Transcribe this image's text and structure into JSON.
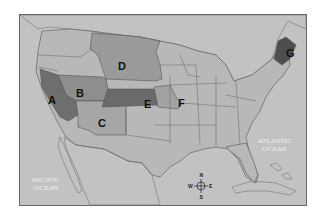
{
  "map": {
    "title": "",
    "colors": {
      "ocean": "#c2c2c2",
      "canada": "#e2e2e2",
      "mexico": "#e4e4e4",
      "us_default": "#b8b8b8",
      "region_A": "#6e6e6e",
      "region_B": "#8e8e8e",
      "region_C": "#a6a6a6",
      "region_D": "#9a9a9a",
      "region_E": "#6a6a6a",
      "region_F": "#a2a2a2",
      "region_G": "#4e4e4e",
      "frame": "#6a6a6a"
    },
    "regions": [
      {
        "id": "A",
        "label": "A",
        "area": "California"
      },
      {
        "id": "B",
        "label": "B",
        "area": "Nevada / Utah"
      },
      {
        "id": "C",
        "label": "C",
        "area": "Arizona / New Mexico"
      },
      {
        "id": "D",
        "label": "D",
        "area": "Montana / Wyoming / Dakotas / Nebraska"
      },
      {
        "id": "E",
        "label": "E",
        "area": "Kansas"
      },
      {
        "id": "F",
        "label": "F",
        "area": "Missouri"
      },
      {
        "id": "G",
        "label": "G",
        "area": "Maine"
      }
    ],
    "oceans": {
      "pacific_line1": "PACIFIC",
      "pacific_line2": "OCEAN",
      "atlantic_line1": "ATLANTIC",
      "atlantic_line2": "OCEAN"
    },
    "compass": {
      "n": "N",
      "s": "S",
      "e": "E",
      "w": "W"
    }
  }
}
